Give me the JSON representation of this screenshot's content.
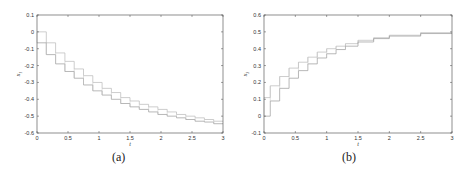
{
  "chart_data": [
    {
      "type": "line",
      "panel": "a",
      "caption": "(a)",
      "title": "",
      "xlabel": "t",
      "ylabel": "x_1",
      "xlim": [
        0,
        3
      ],
      "ylim": [
        -0.6,
        0.1
      ],
      "xticks": [
        "0",
        "0.5",
        "1",
        "1.5",
        "2",
        "2.5",
        "3"
      ],
      "yticks": [
        "0.1",
        "0",
        "-0.1",
        "-0.2",
        "-0.3",
        "-0.4",
        "-0.5",
        "-0.6"
      ],
      "grid": false,
      "style": "step interval bounds (upper and lower)",
      "series": [
        {
          "name": "upper",
          "x": [
            0,
            0.15,
            0.3,
            0.45,
            0.6,
            0.75,
            0.9,
            1.05,
            1.2,
            1.35,
            1.5,
            1.65,
            1.8,
            1.95,
            2.1,
            2.25,
            2.4,
            2.55,
            2.7,
            2.85,
            3.0
          ],
          "values": [
            0,
            -0.065,
            -0.125,
            -0.175,
            -0.22,
            -0.26,
            -0.3,
            -0.335,
            -0.36,
            -0.39,
            -0.41,
            -0.43,
            -0.445,
            -0.46,
            -0.475,
            -0.49,
            -0.5,
            -0.51,
            -0.52,
            -0.53,
            -0.535
          ]
        },
        {
          "name": "lower",
          "x": [
            0,
            0.15,
            0.3,
            0.45,
            0.6,
            0.75,
            0.9,
            1.05,
            1.2,
            1.35,
            1.5,
            1.65,
            1.8,
            1.95,
            2.1,
            2.25,
            2.4,
            2.55,
            2.7,
            2.85,
            3.0
          ],
          "values": [
            -0.065,
            -0.135,
            -0.19,
            -0.235,
            -0.275,
            -0.315,
            -0.35,
            -0.375,
            -0.4,
            -0.425,
            -0.445,
            -0.46,
            -0.475,
            -0.49,
            -0.5,
            -0.51,
            -0.52,
            -0.53,
            -0.535,
            -0.545,
            -0.55
          ]
        }
      ]
    },
    {
      "type": "line",
      "panel": "b",
      "caption": "(b)",
      "title": "",
      "xlabel": "t",
      "ylabel": "x_3",
      "xlim": [
        0,
        3
      ],
      "ylim": [
        -0.1,
        0.6
      ],
      "xticks": [
        "0",
        "0.5",
        "1",
        "1.5",
        "2",
        "2.5",
        "3"
      ],
      "yticks": [
        "0.6",
        "0.5",
        "0.4",
        "0.3",
        "0.2",
        "0.1",
        "0",
        "-0.1"
      ],
      "grid": false,
      "style": "step interval bounds (upper and lower)",
      "series": [
        {
          "name": "upper",
          "x": [
            0,
            0.1,
            0.25,
            0.4,
            0.55,
            0.7,
            0.85,
            1.0,
            1.15,
            1.3,
            1.5,
            1.75,
            2.0,
            2.5,
            3.0
          ],
          "values": [
            0.11,
            0.18,
            0.235,
            0.285,
            0.32,
            0.35,
            0.38,
            0.4,
            0.415,
            0.43,
            0.45,
            0.465,
            0.48,
            0.495,
            0.5
          ],
          "note": "approximate"
        },
        {
          "name": "lower",
          "x": [
            0,
            0.1,
            0.25,
            0.4,
            0.55,
            0.7,
            0.85,
            1.0,
            1.15,
            1.3,
            1.5,
            1.75,
            2.0,
            2.5,
            3.0
          ],
          "values": [
            0,
            0.09,
            0.165,
            0.225,
            0.27,
            0.31,
            0.345,
            0.37,
            0.395,
            0.415,
            0.44,
            0.46,
            0.475,
            0.49,
            0.5
          ],
          "note": "approximate"
        }
      ]
    }
  ],
  "captions": {
    "a": "(a)",
    "b": "(b)"
  },
  "axes": {
    "a": {
      "xlabel": "t",
      "ylabel": "x",
      "ylabel_sub": "1"
    },
    "b": {
      "xlabel": "t",
      "ylabel": "x",
      "ylabel_sub": "3"
    }
  }
}
